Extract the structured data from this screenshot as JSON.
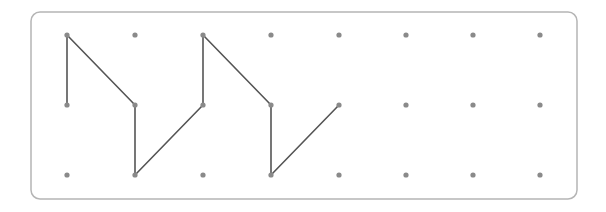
{
  "diagram": {
    "type": "geoboard-dot-grid",
    "frame": {
      "x": 31,
      "y": 12,
      "width": 546,
      "height": 187,
      "radius": 9,
      "stroke": "#b5b5b5"
    },
    "grid": {
      "columns": 8,
      "rows": 3,
      "x_positions": [
        67,
        135,
        203,
        271,
        339,
        406,
        473,
        540
      ],
      "y_positions": [
        35,
        105,
        175
      ],
      "dot_color": "#8a8a8a",
      "dot_radius": 2.6
    },
    "path": {
      "color": "#555555",
      "width": 1.6,
      "points": [
        [
          0,
          1
        ],
        [
          0,
          0
        ],
        [
          1,
          1
        ],
        [
          1,
          2
        ],
        [
          2,
          1
        ],
        [
          2,
          0
        ],
        [
          3,
          1
        ],
        [
          3,
          2
        ],
        [
          4,
          1
        ]
      ]
    }
  }
}
